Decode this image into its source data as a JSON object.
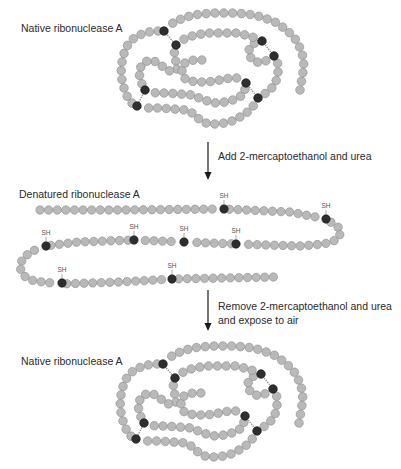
{
  "colors": {
    "bead_fill": "#b9b9b9",
    "bead_stroke": "#8a8a8a",
    "cysteine_fill": "#2e2e2e",
    "arrow": "#1a1a1a",
    "bond": "#9a9a9a"
  },
  "labels": {
    "native_top": "Native ribonuclease A",
    "denatured": "Denatured ribonuclease A",
    "native_bottom": "Native ribonuclease A"
  },
  "steps": {
    "step1": "Add 2-mercaptoethanol and urea",
    "step2_line1": "Remove 2-mercaptoethanol and urea",
    "step2_line2": "and expose to air"
  },
  "sh_label": "SH",
  "native_structure": {
    "bead_radius": 4.3,
    "paths": [
      [
        [
          300,
          90
        ],
        [
          302,
          78
        ],
        [
          304,
          66
        ],
        [
          302,
          52
        ],
        [
          296,
          40
        ],
        [
          287,
          30
        ],
        [
          275,
          22
        ],
        [
          262,
          17
        ],
        [
          248,
          14
        ],
        [
          232,
          13
        ],
        [
          216,
          13
        ],
        [
          200,
          14
        ],
        [
          186,
          17
        ],
        [
          174,
          22
        ],
        [
          164,
          31
        ],
        [
          154,
          31
        ],
        [
          144,
          33
        ],
        [
          134,
          38
        ],
        [
          127,
          46
        ],
        [
          123,
          56
        ],
        [
          121,
          68
        ],
        [
          122,
          80
        ],
        [
          125,
          92
        ],
        [
          130,
          102
        ],
        [
          137,
          106
        ],
        [
          146,
          108
        ],
        [
          160,
          108
        ],
        [
          174,
          109
        ],
        [
          186,
          110
        ],
        [
          194,
          114
        ],
        [
          200,
          120
        ],
        [
          208,
          124
        ],
        [
          220,
          124
        ],
        [
          232,
          121
        ],
        [
          244,
          115
        ],
        [
          252,
          108
        ],
        [
          258,
          98
        ],
        [
          266,
          93
        ],
        [
          274,
          86
        ],
        [
          278,
          76
        ],
        [
          278,
          64
        ],
        [
          274,
          56
        ],
        [
          268,
          60
        ],
        [
          260,
          63
        ],
        [
          252,
          60
        ],
        [
          248,
          52
        ],
        [
          252,
          44
        ],
        [
          262,
          41
        ],
        [
          250,
          36
        ],
        [
          236,
          33
        ],
        [
          220,
          33
        ],
        [
          206,
          33
        ],
        [
          192,
          36
        ],
        [
          182,
          40
        ],
        [
          176,
          45
        ],
        [
          174,
          54
        ],
        [
          176,
          62
        ],
        [
          178,
          68
        ],
        [
          174,
          72
        ],
        [
          166,
          70
        ],
        [
          160,
          64
        ],
        [
          152,
          60
        ],
        [
          144,
          62
        ],
        [
          139,
          70
        ],
        [
          140,
          80
        ],
        [
          145,
          90
        ],
        [
          156,
          93
        ],
        [
          168,
          93
        ],
        [
          180,
          94
        ],
        [
          192,
          95
        ],
        [
          204,
          100
        ],
        [
          214,
          103
        ],
        [
          226,
          102
        ],
        [
          236,
          99
        ],
        [
          244,
          94
        ],
        [
          246,
          83
        ],
        [
          240,
          78
        ],
        [
          230,
          78
        ],
        [
          220,
          80
        ],
        [
          208,
          82
        ],
        [
          196,
          82
        ],
        [
          186,
          80
        ],
        [
          182,
          74
        ],
        [
          182,
          66
        ],
        [
          186,
          62
        ],
        [
          194,
          60
        ],
        [
          202,
          60
        ]
      ]
    ],
    "bonds": [
      [
        [
          164,
          31
        ],
        [
          176,
          45
        ]
      ],
      [
        [
          262,
          41
        ],
        [
          274,
          56
        ]
      ],
      [
        [
          145,
          90
        ],
        [
          137,
          106
        ]
      ],
      [
        [
          246,
          83
        ],
        [
          258,
          98
        ]
      ]
    ],
    "cysteines": [
      [
        164,
        31
      ],
      [
        176,
        45
      ],
      [
        262,
        41
      ],
      [
        274,
        56
      ],
      [
        145,
        90
      ],
      [
        137,
        106
      ],
      [
        246,
        83
      ],
      [
        258,
        98
      ]
    ]
  },
  "native_offsets": {
    "top": [
      0,
      0
    ],
    "bottom": [
      -1,
      333
    ]
  },
  "denatured_structure": {
    "bead_radius": 4.2,
    "path": [
      [
        40,
        210
      ],
      [
        120,
        210
      ],
      [
        224,
        209
      ],
      [
        290,
        212
      ],
      [
        326,
        219
      ],
      [
        338,
        227
      ],
      [
        341,
        233
      ],
      [
        336,
        240
      ],
      [
        324,
        244
      ],
      [
        300,
        246
      ],
      [
        236,
        244
      ],
      [
        184,
        242
      ],
      [
        134,
        240
      ],
      [
        78,
        242
      ],
      [
        46,
        246
      ],
      [
        30,
        252
      ],
      [
        22,
        260
      ],
      [
        20,
        268
      ],
      [
        24,
        276
      ],
      [
        34,
        281
      ],
      [
        60,
        284
      ],
      [
        120,
        282
      ],
      [
        172,
        279
      ],
      [
        276,
        277
      ]
    ],
    "cysteines": [
      [
        224,
        209
      ],
      [
        326,
        219
      ],
      [
        236,
        244
      ],
      [
        184,
        242
      ],
      [
        134,
        240
      ],
      [
        46,
        246
      ],
      [
        62,
        283
      ],
      [
        172,
        279
      ]
    ]
  },
  "arrows": [
    {
      "x": 208,
      "y1": 142,
      "y2": 180
    },
    {
      "x": 208,
      "y1": 290,
      "y2": 331
    }
  ]
}
